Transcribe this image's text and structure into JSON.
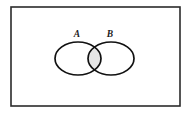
{
  "figure": {
    "type": "venn-diagram",
    "title": "",
    "universe": {
      "name": "universal-set-rectangle",
      "label": "",
      "x": 11,
      "y": 7,
      "width": 169,
      "height": 99,
      "stroke_color": "#2b2b2b",
      "stroke_width": 1.6,
      "fill_color": "#ffffff"
    },
    "sets": [
      {
        "id": "A",
        "label": "A",
        "label_x": 77,
        "label_y": 37,
        "cx": 78,
        "cy": 58.5,
        "rx": 23,
        "ry": 16.5,
        "stroke_color": "#111111",
        "stroke_width": 1.7,
        "fill_color": "#ffffff"
      },
      {
        "id": "B",
        "label": "B",
        "label_x": 110,
        "label_y": 37,
        "cx": 111,
        "cy": 58.5,
        "rx": 23,
        "ry": 16.5,
        "stroke_color": "#111111",
        "stroke_width": 1.7,
        "fill_color": "#ffffff"
      }
    ],
    "shaded_region": {
      "name": "intersection-a-and-b",
      "description": "A intersect B",
      "fill_color": "#e6e6e6",
      "x_range": [
        85,
        104
      ],
      "y_range": [
        42,
        75
      ]
    },
    "background_color": "#ffffff"
  }
}
